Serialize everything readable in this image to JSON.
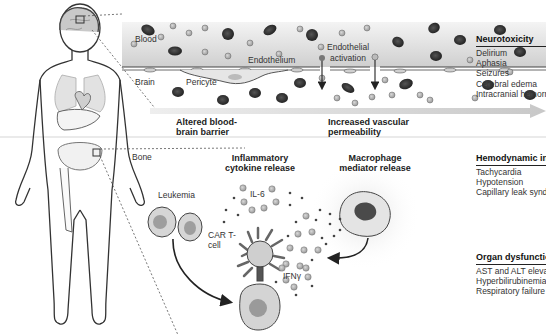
{
  "figure": {
    "top_panel": {
      "labels": {
        "blood": "Blood",
        "brain": "Brain",
        "pericyte": "Pericyte",
        "endothelium": "Endothelium",
        "endothelial_activation_line1": "Endothelial",
        "endothelial_activation_line2": "activation"
      },
      "arrow_captions": {
        "altered_bbb_line1": "Altered blood-",
        "altered_bbb_line2": "brain barrier",
        "vascular_line1": "Increased vascular",
        "vascular_line2": "permeability"
      }
    },
    "bottom_panel": {
      "bone_label": "Bone",
      "inflammatory_line1": "Inflammatory",
      "inflammatory_line2": "cytokine release",
      "macrophage_line1": "Macrophage",
      "macrophage_line2": "mediator release",
      "leukemia_label": "Leukemia",
      "il6_label": "IL-6",
      "car_t_line1": "CAR T-",
      "car_t_line2": "cell",
      "ifn_label": "IFNγ"
    },
    "sidebar": [
      {
        "title": "Neurotoxicity",
        "items": [
          "Delirium",
          "Aphasia",
          "Seizures",
          "Cerebral edema",
          "Intracranial hemorrhage"
        ]
      },
      {
        "title": "Hemodynamic instability",
        "items": [
          "Tachycardia",
          "Hypotension",
          "Capillary leak syndrome"
        ]
      },
      {
        "title": "Organ dysfunction",
        "items": [
          "AST and ALT elevation",
          "Hyperbilirubinemia",
          "Respiratory failure"
        ]
      }
    ],
    "colors": {
      "vessel_band": "#d6d6d6",
      "red_cell": "#2e2e2e",
      "cytokine": "#9a9a9a",
      "outline": "#333333",
      "divider": "#dcdcdc"
    }
  }
}
